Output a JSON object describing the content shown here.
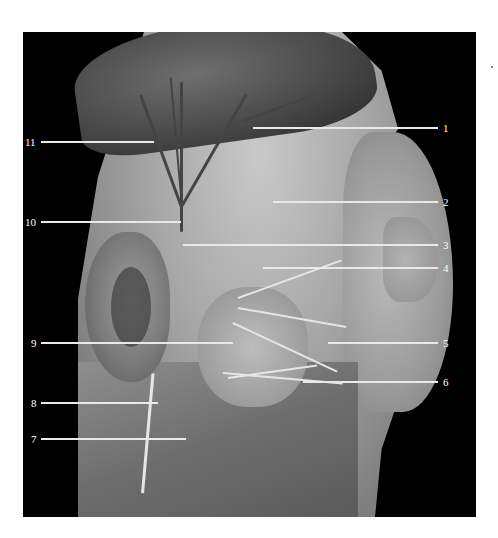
{
  "figure": {
    "colors": {
      "background": "#000000",
      "label": "#ffffff",
      "leader": "#e9e9e9",
      "page": "#ffffff"
    },
    "labels": [
      {
        "id": "1",
        "text": "1",
        "side": "right",
        "y": 128
      },
      {
        "id": "2",
        "text": "2",
        "side": "right",
        "y": 201
      },
      {
        "id": "3",
        "text": "3",
        "side": "right",
        "y": 244
      },
      {
        "id": "4",
        "text": "4",
        "side": "right",
        "y": 267
      },
      {
        "id": "5",
        "text": "5",
        "side": "right",
        "y": 342
      },
      {
        "id": "6",
        "text": "6",
        "side": "right",
        "y": 381
      },
      {
        "id": "7",
        "text": "7",
        "side": "left",
        "y": 438
      },
      {
        "id": "8",
        "text": "8",
        "side": "left",
        "y": 402
      },
      {
        "id": "9",
        "text": "9",
        "side": "left",
        "y": 342
      },
      {
        "id": "10",
        "text": "10",
        "side": "left",
        "y": 221
      },
      {
        "id": "11",
        "text": "11",
        "side": "left",
        "y": 141
      }
    ]
  }
}
